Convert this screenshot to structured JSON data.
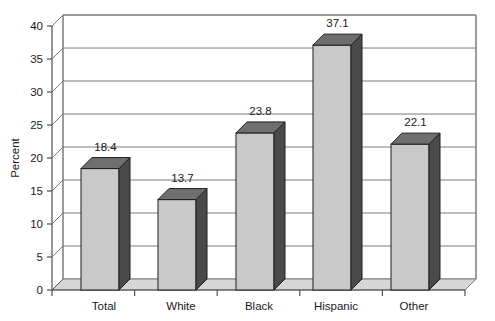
{
  "chart_data": {
    "type": "bar",
    "title": "",
    "subtitle": "",
    "xlabel": "",
    "ylabel": "Percent",
    "categories": [
      "Total",
      "White",
      "Black",
      "Hispanic",
      "Other"
    ],
    "values": [
      18.4,
      13.7,
      23.8,
      37.1,
      22.1
    ],
    "value_labels": [
      "18.4",
      "13.7",
      "23.8",
      "37.1",
      "22.1"
    ],
    "ylim": [
      0,
      40
    ],
    "ytick_step": 5,
    "ytick_labels": [
      "0",
      "5",
      "10",
      "15",
      "20",
      "25",
      "30",
      "35",
      "40"
    ],
    "ytick_values": [
      0,
      5,
      10,
      15,
      20,
      25,
      30,
      35,
      40
    ],
    "grid": true,
    "grid_axis": "y",
    "legend": false,
    "legend_position": "none",
    "style": "3d-column",
    "series": [
      {
        "name": "Percent",
        "values": [
          18.4,
          13.7,
          23.8,
          37.1,
          22.1
        ]
      }
    ]
  },
  "colors": {
    "bar_front": "#c9c9c9",
    "bar_side": "#4a4a4a",
    "bar_top": "#6f6f6f",
    "bar_outline": "#1f1f1f",
    "floor": "#d6d6d6",
    "wall": "#ffffff",
    "gridline": "#7a7a7a",
    "axis": "#4f4f4f",
    "text": "#1a1a1a",
    "background": "#ffffff"
  },
  "geometry": {
    "origin_x": 52,
    "origin_y": 290,
    "plot_right": 465,
    "plot_top": 26,
    "depth_dx": 11,
    "depth_dy": 11,
    "bar_width": 38,
    "px_per_unit": 6.6,
    "bar_centers": [
      100,
      177,
      255,
      332,
      410
    ]
  }
}
